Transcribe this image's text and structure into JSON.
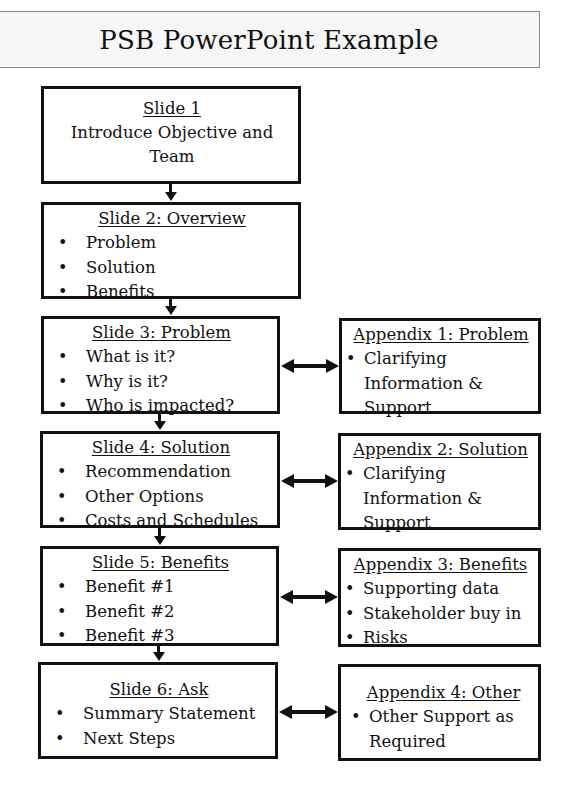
{
  "title": "PSB PowerPoint Example",
  "slides": [
    {
      "title": "Slide 1",
      "subtitle": "Introduce Objective and Team",
      "items": []
    },
    {
      "title": "Slide 2: Overview",
      "items": [
        "Problem",
        "Solution",
        "Benefits"
      ]
    },
    {
      "title": "Slide 3: Problem",
      "items": [
        "What is it?",
        "Why is it?",
        "Who is impacted?"
      ]
    },
    {
      "title": "Slide 4: Solution",
      "items": [
        "Recommendation",
        "Other Options",
        "Costs and Schedules"
      ]
    },
    {
      "title": "Slide 5: Benefits",
      "items": [
        "Benefit #1",
        "Benefit #2",
        "Benefit #3"
      ]
    },
    {
      "title": "Slide 6: Ask",
      "items": [
        "Summary Statement",
        "Next Steps"
      ]
    }
  ],
  "appendices": [
    {
      "title": "Appendix 1: Problem",
      "items": [
        "Clarifying"
      ],
      "continuation": [
        "Information &",
        "Support"
      ]
    },
    {
      "title": "Appendix 2: Solution",
      "items": [
        "Clarifying"
      ],
      "continuation": [
        "Information &",
        "Support"
      ]
    },
    {
      "title": "Appendix 3: Benefits",
      "items": [
        "Supporting data",
        "Stakeholder buy in",
        "Risks"
      ],
      "continuation": []
    },
    {
      "title": "Appendix 4: Other",
      "items": [
        "Other Support as"
      ],
      "continuation": [
        "Required"
      ]
    }
  ],
  "colors": {
    "border": "#111111",
    "title_fill": "#f6f6f6",
    "title_border": "#8a8a8a"
  }
}
